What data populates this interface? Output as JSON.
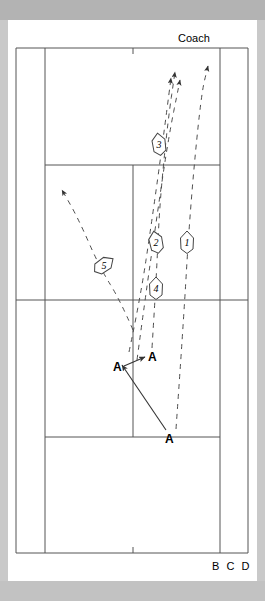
{
  "diagram": {
    "title_label": "Coach",
    "footer_label": "B C D",
    "court": {
      "surface_color": "#ffffff",
      "line_color": "#555555",
      "outer": {
        "x": 16,
        "y": 48,
        "w": 232,
        "h": 505
      },
      "singles_left_x": 45,
      "singles_right_x": 220,
      "service_line_top_y": 165,
      "service_line_bottom_y": 437,
      "net_y": 300,
      "center_service_line_x": 133,
      "center_mark_top_y": 48,
      "center_mark_bottom_y": 553
    },
    "frame": {
      "band_top_color": "#b3b3b3",
      "band_side_color": "#c9c9c9",
      "band_bottom_color": "#c2c2c2"
    },
    "ball_markers": [
      {
        "id": "1",
        "label": "1",
        "x": 187,
        "y": 242,
        "rotation": 0
      },
      {
        "id": "2",
        "label": "2",
        "x": 156,
        "y": 242,
        "rotation": -12
      },
      {
        "id": "3",
        "label": "3",
        "x": 159,
        "y": 144,
        "rotation": -8
      },
      {
        "id": "4",
        "label": "4",
        "x": 156,
        "y": 288,
        "rotation": 0
      },
      {
        "id": "5",
        "label": "5",
        "x": 104,
        "y": 265,
        "rotation": 55
      }
    ],
    "player_markers": [
      {
        "label": "A",
        "x": 117,
        "y": 369,
        "name": "player-a-left-near-net"
      },
      {
        "label": "A",
        "x": 152,
        "y": 359,
        "name": "player-a-right-near-net"
      },
      {
        "label": "A",
        "x": 169,
        "y": 441,
        "name": "player-a-baseline"
      }
    ],
    "trajectories": [
      {
        "id": "shot-1",
        "style": "dashed",
        "points": [
          [
            176,
            429
          ],
          [
            183,
            330
          ],
          [
            190,
            210
          ],
          [
            201,
            95
          ],
          [
            208,
            66
          ]
        ],
        "arrow": true
      },
      {
        "id": "shot-2",
        "style": "dashed",
        "points": [
          [
            137,
            360
          ],
          [
            145,
            300
          ],
          [
            155,
            230
          ],
          [
            168,
            140
          ],
          [
            180,
            80
          ]
        ],
        "arrow": true
      },
      {
        "id": "shot-3",
        "style": "dashed",
        "points": [
          [
            129,
            352
          ],
          [
            140,
            300
          ],
          [
            152,
            220
          ],
          [
            163,
            140
          ],
          [
            171,
            78
          ]
        ],
        "arrow": true
      },
      {
        "id": "shot-4",
        "style": "dashed",
        "points": [
          [
            152,
            348
          ],
          [
            155,
            300
          ],
          [
            157,
            262
          ],
          [
            160,
            200
          ],
          [
            168,
            120
          ],
          [
            175,
            72
          ]
        ],
        "arrow": true
      },
      {
        "id": "shot-5",
        "style": "dashed",
        "points": [
          [
            133,
            330
          ],
          [
            120,
            300
          ],
          [
            100,
            268
          ],
          [
            78,
            218
          ],
          [
            62,
            190
          ]
        ],
        "arrow": true
      },
      {
        "id": "shot-return",
        "style": "solid",
        "points": [
          [
            166,
            430
          ],
          [
            122,
            365
          ]
        ],
        "arrow": true
      },
      {
        "id": "shot-crosscourt",
        "style": "solid",
        "points": [
          [
            124,
            366
          ],
          [
            145,
            357
          ]
        ],
        "arrow": true
      }
    ],
    "colors": {
      "line": "#555555",
      "dash": "#4d4d4d",
      "text": "#000000"
    }
  }
}
